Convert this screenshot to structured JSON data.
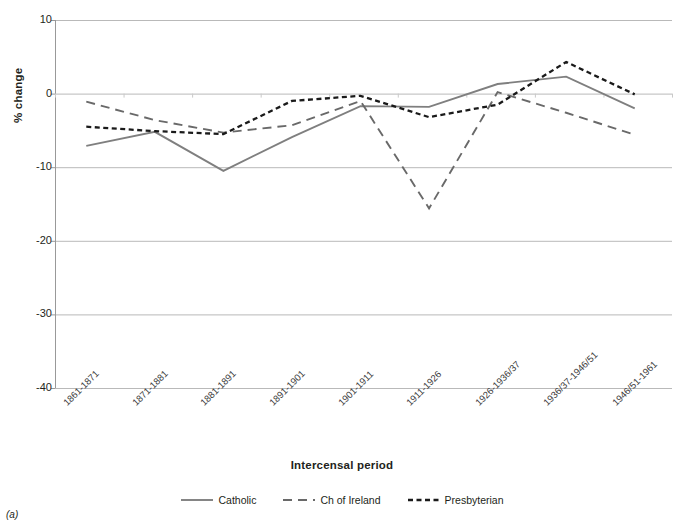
{
  "figure": {
    "panel_label": "(a)",
    "background": "#ffffff"
  },
  "axis": {
    "y_title": "% change",
    "x_title": "Intercensal period",
    "y_ticks": [
      "10",
      "0",
      "-10",
      "-20",
      "-30",
      "-40"
    ]
  },
  "legend": {
    "items": [
      {
        "label": "Catholic",
        "color": "#7f7f7f",
        "style": "solid"
      },
      {
        "label": "Ch of Ireland",
        "color": "#696969",
        "style": "dashed"
      },
      {
        "label": "Presbyterian",
        "color": "#1a1a1a",
        "style": "dotted"
      }
    ]
  },
  "chart_data": {
    "type": "line",
    "title": "",
    "subtitle": "",
    "xlabel": "Intercensal period",
    "ylabel": "% change",
    "ylim": [
      -40,
      10
    ],
    "ytick_step": 10,
    "grid": true,
    "legend_position": "bottom",
    "categories": [
      "1861-1871",
      "1871-1881",
      "1881-1891",
      "1891-1901",
      "1901-1911",
      "1911-1926",
      "1926-1936/37",
      "1936/37-1946/51",
      "1946/51-1961"
    ],
    "series": [
      {
        "name": "Catholic",
        "color": "#7f7f7f",
        "style": "solid",
        "values": [
          -7.1,
          -5.2,
          -10.5,
          -5.9,
          -1.7,
          -1.8,
          1.3,
          2.3,
          -2.0
        ]
      },
      {
        "name": "Ch of Ireland",
        "color": "#696969",
        "style": "dashed",
        "values": [
          -1.1,
          -3.6,
          -5.3,
          -4.3,
          -1.0,
          -15.6,
          0.2,
          -2.6,
          -5.6
        ]
      },
      {
        "name": "Presbyterian",
        "color": "#1a1a1a",
        "style": "dotted",
        "values": [
          -4.5,
          -5.1,
          -5.5,
          -1.0,
          -0.3,
          -3.2,
          -1.5,
          4.3,
          -0.1
        ]
      }
    ]
  },
  "colors": {
    "grid": "#b9b9b9",
    "axis": "#999999",
    "text": "#231f20"
  }
}
